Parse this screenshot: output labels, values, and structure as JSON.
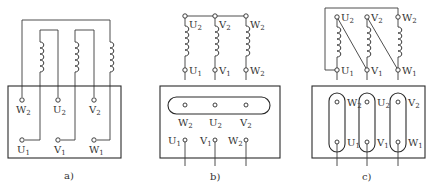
{
  "figure": {
    "panels": [
      {
        "id": "a",
        "caption": "a)",
        "box_terminals_top": [
          {
            "letter": "W",
            "sub": "2"
          },
          {
            "letter": "U",
            "sub": "2"
          },
          {
            "letter": "V",
            "sub": "2"
          }
        ],
        "box_terminals_bottom": [
          {
            "letter": "U",
            "sub": "1"
          },
          {
            "letter": "V",
            "sub": "1"
          },
          {
            "letter": "W",
            "sub": "1"
          }
        ]
      },
      {
        "id": "b",
        "caption": "b)",
        "coil_top_labels": [
          {
            "letter": "U",
            "sub": "2"
          },
          {
            "letter": "V",
            "sub": "2"
          },
          {
            "letter": "W",
            "sub": "2"
          }
        ],
        "coil_bottom_labels": [
          {
            "letter": "U",
            "sub": "1"
          },
          {
            "letter": "V",
            "sub": "1"
          },
          {
            "letter": "W",
            "sub": "2"
          }
        ],
        "box_terminals_top": [
          {
            "letter": "W",
            "sub": "2"
          },
          {
            "letter": "U",
            "sub": "2"
          },
          {
            "letter": "V",
            "sub": "2"
          }
        ],
        "box_terminals_bottom": [
          {
            "letter": "U",
            "sub": "1"
          },
          {
            "letter": "V",
            "sub": "1"
          },
          {
            "letter": "W",
            "sub": "2"
          }
        ]
      },
      {
        "id": "c",
        "caption": "c)",
        "coil_top_labels": [
          {
            "letter": "U",
            "sub": "2"
          },
          {
            "letter": "V",
            "sub": "2"
          },
          {
            "letter": "W",
            "sub": "2"
          }
        ],
        "coil_bottom_labels": [
          {
            "letter": "U",
            "sub": "1"
          },
          {
            "letter": "V",
            "sub": "1"
          },
          {
            "letter": "W",
            "sub": "1"
          }
        ],
        "box_terminals_top": [
          {
            "letter": "W",
            "sub": "2"
          },
          {
            "letter": "U",
            "sub": "2"
          },
          {
            "letter": "V",
            "sub": "2"
          }
        ],
        "box_terminals_bottom": [
          {
            "letter": "U",
            "sub": "1"
          },
          {
            "letter": "V",
            "sub": "1"
          },
          {
            "letter": "W",
            "sub": "1"
          }
        ]
      }
    ]
  }
}
